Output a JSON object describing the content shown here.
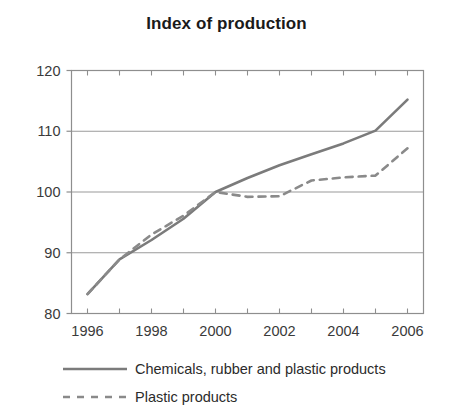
{
  "chart_data": {
    "type": "line",
    "title": "Index of production",
    "xlabel": "",
    "ylabel": "",
    "x": [
      1996,
      1997,
      1998,
      1999,
      2000,
      2001,
      2002,
      2003,
      2004,
      2005,
      2006
    ],
    "xlim": [
      1995.5,
      2006.5
    ],
    "ylim": [
      80,
      120
    ],
    "yticks": [
      80,
      90,
      100,
      110,
      120
    ],
    "xticks": [
      1996,
      1997,
      1998,
      1999,
      2000,
      2001,
      2002,
      2003,
      2004,
      2005,
      2006
    ],
    "xtick_labels_shown": [
      "1996",
      "1998",
      "2000",
      "2002",
      "2004",
      "2006"
    ],
    "xtick_labels_shown_values": [
      1996,
      1998,
      2000,
      2002,
      2004,
      2006
    ],
    "ytick_labels": [
      "80",
      "90",
      "100",
      "110",
      "120"
    ],
    "grid": "horizontal",
    "legend_position": "bottom-left",
    "series": [
      {
        "name": "Chemicals, rubber and plastic products",
        "style": "solid",
        "color": "#7b7b7b",
        "values": [
          83.2,
          88.9,
          92.1,
          95.6,
          100.0,
          102.3,
          104.4,
          106.2,
          108.0,
          110.1,
          115.2
        ]
      },
      {
        "name": "Plastic products",
        "style": "dashed",
        "color": "#8a8a8a",
        "values": [
          83.2,
          88.9,
          93.0,
          96.1,
          100.0,
          99.2,
          99.3,
          101.9,
          102.4,
          102.7,
          107.2
        ]
      }
    ]
  },
  "legend": {
    "items": [
      {
        "label": "Chemicals, rubber and plastic products",
        "style": "solid"
      },
      {
        "label": "Plastic products",
        "style": "dashed"
      }
    ]
  },
  "axis": {
    "frame_color": "#8e8e8e",
    "grid_color": "#9a9a9a",
    "tick_color": "#8e8e8e"
  }
}
